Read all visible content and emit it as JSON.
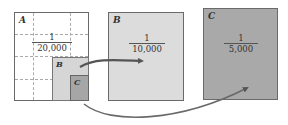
{
  "diagram": {
    "panels": [
      {
        "id": "A",
        "label": "A",
        "scale_numerator": "1",
        "scale_denominator": "20,000",
        "fill": "#ffffff"
      },
      {
        "id": "B",
        "label": "B",
        "scale_numerator": "1",
        "scale_denominator": "10,000",
        "fill": "#dcdcdc"
      },
      {
        "id": "C",
        "label": "C",
        "scale_numerator": "1",
        "scale_denominator": "5,000",
        "fill": "#a9a9a9"
      }
    ],
    "sub_regions": [
      {
        "id": "B",
        "label": "B"
      },
      {
        "id": "C",
        "label": "C"
      }
    ],
    "arrows": [
      {
        "from": "sub-region B in A",
        "to": "panel B"
      },
      {
        "from": "sub-region C in A",
        "to": "panel C"
      }
    ],
    "colors": {
      "border": "#6a6a6a",
      "arrow": "#555555",
      "grid": "#aaaaaa"
    }
  }
}
